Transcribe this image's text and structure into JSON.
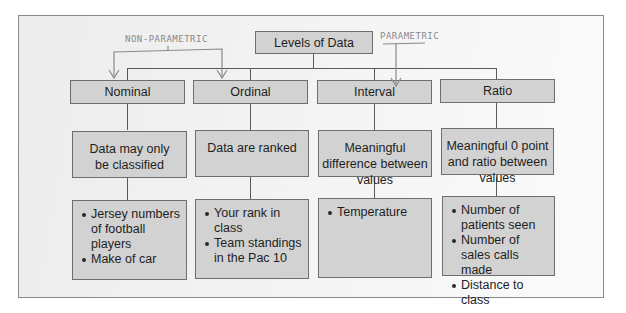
{
  "diagram": {
    "root": {
      "label": "Levels of Data"
    },
    "annotations": {
      "non_parametric": "NON-PARAMETRIC",
      "parametric": "PARAMETRIC"
    },
    "levels": [
      {
        "name": "Nominal",
        "description": "Data may only be classified",
        "examples": [
          "Jersey numbers of football players",
          "Make of car"
        ]
      },
      {
        "name": "Ordinal",
        "description": "Data are ranked",
        "examples": [
          "Your rank in class",
          "Team standings in the Pac 10"
        ]
      },
      {
        "name": "Interval",
        "description": "Meaningful difference between values",
        "examples": [
          "Temperature"
        ]
      },
      {
        "name": "Ratio",
        "description": "Meaningful 0 point and ratio between values",
        "examples": [
          "Number of patients seen",
          "Number of sales calls made",
          "Distance to class"
        ]
      }
    ]
  }
}
